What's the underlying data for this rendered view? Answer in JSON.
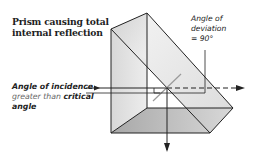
{
  "title": {
    "line1": "Prism causing total",
    "line2": "internal reflection"
  },
  "deviation_label": {
    "line1": "Angle of",
    "line2": "deviation",
    "line3": "= 90°"
  },
  "incidence_label": {
    "part1": "Angle of incidence",
    "part2": "greater than",
    "part3": "critical",
    "part4": "angle"
  },
  "colors": {
    "outline": "#222222",
    "prism_light": "#e6e6e6",
    "prism_mid": "#cfcfcf",
    "prism_dark": "#a9a9a9",
    "normal_line": "#9a9a9a"
  }
}
